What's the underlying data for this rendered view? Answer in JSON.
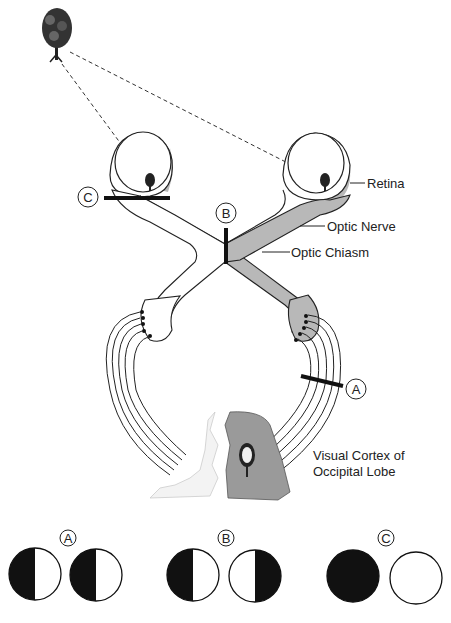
{
  "diagram": {
    "labels": {
      "retina": "Retina",
      "optic_nerve": "Optic Nerve",
      "optic_chiasm": "Optic Chiasm",
      "visual_cortex_line1": "Visual Cortex of",
      "visual_cortex_line2": "Occipital Lobe"
    },
    "lesion_markers": {
      "a": "A",
      "b": "B",
      "c": "C"
    },
    "visual_field_defects": [
      {
        "label": "A",
        "left_eye": "left half dark",
        "right_eye": "left half dark"
      },
      {
        "label": "B",
        "left_eye": "left half dark",
        "right_eye": "right half dark"
      },
      {
        "label": "C",
        "left_eye": "fully dark",
        "right_eye": "clear"
      }
    ],
    "colors": {
      "shade": "#b8b8b8",
      "cortex_shade": "#9a9a9a",
      "ink": "#111111"
    }
  }
}
